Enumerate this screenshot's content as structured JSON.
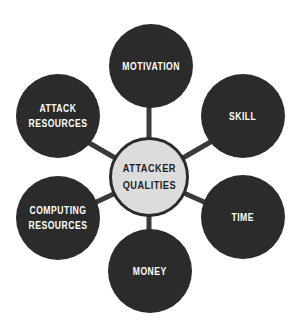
{
  "diagram": {
    "title": "Attacker Qualities",
    "colors": {
      "outer_fill": "#2b2b2b",
      "outer_text": "#ffffff",
      "center_fill": "#dcdcdc",
      "center_border": "#2b2b2b",
      "connector": "#3a3a3a",
      "background": "#ffffff"
    },
    "center": {
      "line1": "ATTACKER",
      "line2": "QUALITIES"
    },
    "nodes": [
      {
        "id": "motivation",
        "line1": "MOTIVATION",
        "line2": ""
      },
      {
        "id": "skill",
        "line1": "SKILL",
        "line2": ""
      },
      {
        "id": "time",
        "line1": "TIME",
        "line2": ""
      },
      {
        "id": "money",
        "line1": "MONEY",
        "line2": ""
      },
      {
        "id": "computing-resources",
        "line1": "COMPUTING",
        "line2": "RESOURCES"
      },
      {
        "id": "attack-resources",
        "line1": "ATTACK",
        "line2": "RESOURCES"
      }
    ]
  }
}
